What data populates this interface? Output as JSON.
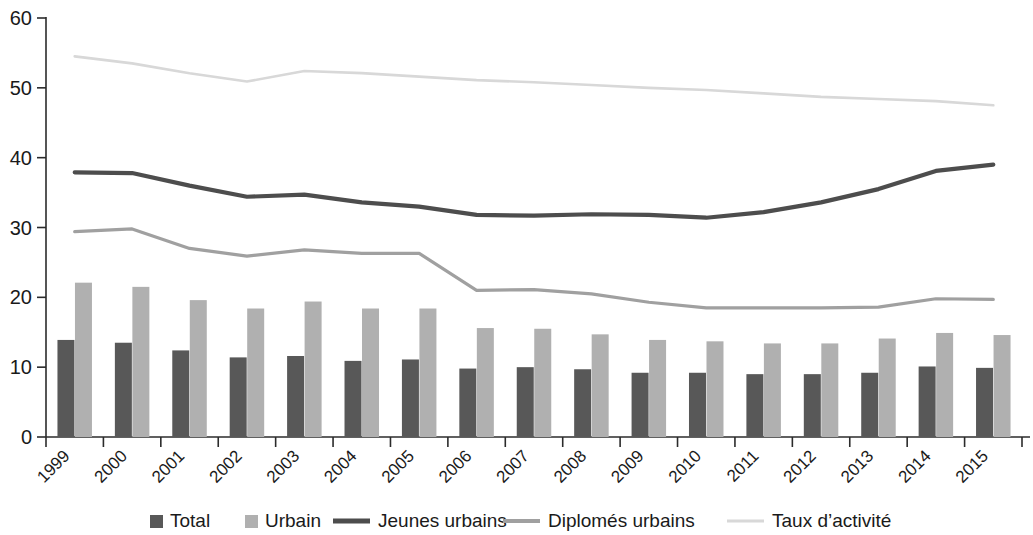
{
  "chart_data": {
    "type": "bar",
    "title": "",
    "subtitle": "",
    "xlabel": "",
    "ylabel": "",
    "ylim": [
      0,
      60
    ],
    "ytick_values": [
      0,
      10,
      20,
      30,
      40,
      50,
      60
    ],
    "ytick_labels": [
      "0",
      "10",
      "20",
      "30",
      "40",
      "50",
      "60"
    ],
    "grid": false,
    "legend_position": "bottom",
    "categories": [
      "1999",
      "2000",
      "2001",
      "2002",
      "2003",
      "2004",
      "2005",
      "2006",
      "2007",
      "2008",
      "2009",
      "2010",
      "2011",
      "2012",
      "2013",
      "2014",
      "2015"
    ],
    "series": [
      {
        "name": "Total",
        "kind": "bar",
        "color": "#585858",
        "values": [
          13.9,
          13.5,
          12.4,
          11.4,
          11.6,
          10.9,
          11.1,
          9.8,
          10.0,
          9.7,
          9.2,
          9.2,
          9.0,
          9.0,
          9.2,
          10.1,
          9.9
        ]
      },
      {
        "name": "Urbain",
        "kind": "bar",
        "color": "#b0b0b0",
        "values": [
          22.1,
          21.5,
          19.6,
          18.4,
          19.4,
          18.4,
          18.4,
          15.6,
          15.5,
          14.7,
          13.9,
          13.7,
          13.4,
          13.4,
          14.1,
          14.9,
          14.6
        ]
      },
      {
        "name": "Jeunes urbains",
        "kind": "line",
        "color": "#4d4d4d",
        "values": [
          37.9,
          37.8,
          36.0,
          34.4,
          34.7,
          33.6,
          33.0,
          31.8,
          31.7,
          31.9,
          31.8,
          31.4,
          32.2,
          33.6,
          35.5,
          38.1,
          39.0
        ]
      },
      {
        "name": "Diplomés urbains",
        "kind": "line",
        "color": "#a0a0a0",
        "values": [
          29.4,
          29.8,
          27.0,
          25.9,
          26.8,
          26.3,
          26.3,
          21.0,
          21.1,
          20.5,
          19.3,
          18.5,
          18.5,
          18.5,
          18.6,
          19.8,
          19.7
        ]
      },
      {
        "name": "Taux d’activité",
        "kind": "line",
        "color": "#d8d8d8",
        "values": [
          54.5,
          53.5,
          52.1,
          50.9,
          52.4,
          52.1,
          51.6,
          51.1,
          50.8,
          50.4,
          50.0,
          49.7,
          49.2,
          48.7,
          48.4,
          48.1,
          47.5
        ]
      }
    ]
  },
  "legend": {
    "items": [
      {
        "label": "Total",
        "marker": "square",
        "color": "#585858"
      },
      {
        "label": "Urbain",
        "marker": "square",
        "color": "#b0b0b0"
      },
      {
        "label": "Jeunes urbains",
        "marker": "line",
        "color": "#4d4d4d"
      },
      {
        "label": "Diplomés urbains",
        "marker": "line",
        "color": "#a0a0a0"
      },
      {
        "label": "Taux d’activité",
        "marker": "line",
        "color": "#d8d8d8"
      }
    ]
  },
  "axes": {
    "y_labels": [
      "60",
      "50",
      "40",
      "30",
      "20",
      "10",
      "0"
    ],
    "x_labels": [
      "1999",
      "2000",
      "2001",
      "2002",
      "2003",
      "2004",
      "2005",
      "2006",
      "2007",
      "2008",
      "2009",
      "2010",
      "2011",
      "2012",
      "2013",
      "2014",
      "2015"
    ]
  }
}
